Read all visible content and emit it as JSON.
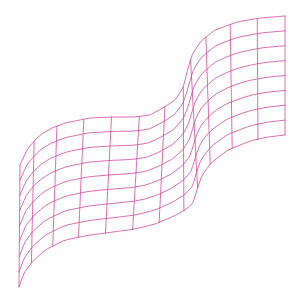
{
  "chart_data": {
    "type": "surface-wireframe",
    "title": "",
    "xlabel": "",
    "ylabel": "",
    "zlabel": "",
    "axes_visible": false,
    "grid": false,
    "legend": null,
    "line_color": "#d6479e",
    "line_width": 0.8,
    "rows": 8,
    "columns": 12,
    "top_edge": [
      [
        20,
        165
      ],
      [
        28,
        148
      ],
      [
        40,
        135
      ],
      [
        52,
        128
      ],
      [
        65,
        123
      ],
      [
        90,
        118
      ],
      [
        113,
        117
      ],
      [
        135,
        117
      ],
      [
        150,
        115
      ],
      [
        163,
        108
      ],
      [
        175,
        100
      ],
      [
        183,
        88
      ],
      [
        187,
        72
      ],
      [
        192,
        55
      ],
      [
        200,
        42
      ],
      [
        215,
        30
      ],
      [
        237,
        22
      ],
      [
        260,
        18
      ],
      [
        285,
        16
      ]
    ],
    "bottom_edge": [
      [
        19,
        287
      ],
      [
        24,
        273
      ],
      [
        32,
        262
      ],
      [
        45,
        250
      ],
      [
        65,
        240
      ],
      [
        90,
        235
      ],
      [
        113,
        232
      ],
      [
        135,
        229
      ],
      [
        155,
        224
      ],
      [
        172,
        217
      ],
      [
        185,
        210
      ],
      [
        193,
        203
      ],
      [
        197,
        190
      ],
      [
        202,
        175
      ],
      [
        212,
        162
      ],
      [
        228,
        150
      ],
      [
        250,
        141
      ],
      [
        268,
        137
      ],
      [
        285,
        135
      ]
    ]
  },
  "background": "#ffffff"
}
